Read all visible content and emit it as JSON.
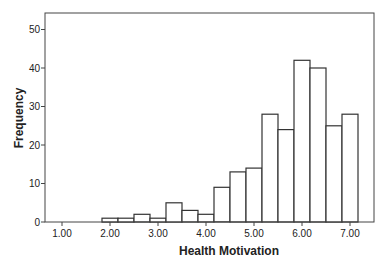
{
  "chart_data": {
    "type": "bar",
    "subtype": "histogram",
    "title": "",
    "xlabel": "Health Motivation",
    "ylabel": "Frequency",
    "x_tick_labels": [
      "1.00",
      "2.00",
      "3.00",
      "4.00",
      "5.00",
      "6.00",
      "7.00"
    ],
    "x_ticks": [
      1,
      2,
      3,
      4,
      5,
      6,
      7
    ],
    "y_tick_labels": [
      "0",
      "10",
      "20",
      "30",
      "40",
      "50"
    ],
    "y_ticks": [
      0,
      10,
      20,
      30,
      40,
      50
    ],
    "xlim": [
      0.65,
      7.5
    ],
    "ylim": [
      0,
      54
    ],
    "bin_width": 0.3333,
    "categories": [
      "2.00",
      "2.33",
      "2.67",
      "3.00",
      "3.33",
      "3.67",
      "4.00",
      "4.33",
      "4.67",
      "5.00",
      "5.33",
      "5.67",
      "6.00",
      "6.33",
      "6.67",
      "7.00"
    ],
    "bin_centers": [
      2.0,
      2.333,
      2.667,
      3.0,
      3.333,
      3.667,
      4.0,
      4.333,
      4.667,
      5.0,
      5.333,
      5.667,
      6.0,
      6.333,
      6.667,
      7.0
    ],
    "values": [
      1,
      1,
      2,
      1,
      5,
      3,
      2,
      9,
      13,
      14,
      28,
      24,
      42,
      40,
      25,
      28
    ],
    "grid": false,
    "legend": null,
    "bar_fill": "#ffffff",
    "bar_stroke": "#333333"
  }
}
